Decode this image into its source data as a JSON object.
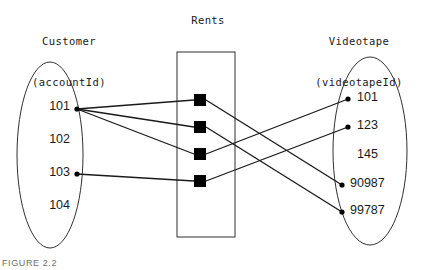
{
  "figure": {
    "caption": "FIGURE 2.2",
    "background_color": "#ffffff",
    "line_color": "#1a1a1a",
    "node_color": "#000000"
  },
  "customer_entity": {
    "heading_line1": "Customer",
    "heading_line2": "(accountId)",
    "attribute": "accountId",
    "values": [
      {
        "label": "101",
        "x": 70,
        "y": 112,
        "dot": true,
        "dot_x": 77,
        "dot_y": 109
      },
      {
        "label": "102",
        "x": 70,
        "y": 145,
        "dot": false,
        "dot_x": 77,
        "dot_y": 141
      },
      {
        "label": "103",
        "x": 70,
        "y": 178,
        "dot": true,
        "dot_x": 77,
        "dot_y": 174
      },
      {
        "label": "104",
        "x": 70,
        "y": 211,
        "dot": false,
        "dot_x": 77,
        "dot_y": 207
      }
    ],
    "ellipse": {
      "cx": 50,
      "cy": 155,
      "rx": 33,
      "ry": 93
    }
  },
  "rents_relationship": {
    "heading": "Rents",
    "box": {
      "x": 177,
      "y": 52,
      "width": 58,
      "height": 185
    },
    "nodes": [
      {
        "id": "rent-node-1",
        "x": 200,
        "y": 100,
        "size": 12
      },
      {
        "id": "rent-node-2",
        "x": 200,
        "y": 127,
        "size": 12
      },
      {
        "id": "rent-node-3",
        "x": 200,
        "y": 154,
        "size": 12
      },
      {
        "id": "rent-node-4",
        "x": 200,
        "y": 181,
        "size": 12
      }
    ]
  },
  "videotape_entity": {
    "heading_line1": "Videotape",
    "heading_line2": "(videotapeId)",
    "attribute": "videotapeId",
    "values": [
      {
        "label": "101",
        "x": 357,
        "y": 103,
        "dot": true,
        "dot_x": 348,
        "dot_y": 99
      },
      {
        "label": "123",
        "x": 357,
        "y": 131,
        "dot": true,
        "dot_x": 348,
        "dot_y": 127
      },
      {
        "label": "145",
        "x": 357,
        "y": 160,
        "dot": false,
        "dot_x": 348,
        "dot_y": 156
      },
      {
        "label": "90987",
        "x": 350,
        "y": 189,
        "dot": true,
        "dot_x": 342,
        "dot_y": 185
      },
      {
        "label": "99787",
        "x": 350,
        "y": 216,
        "dot": true,
        "dot_x": 342,
        "dot_y": 212
      }
    ],
    "ellipse": {
      "cx": 370,
      "cy": 151,
      "rx": 37,
      "ry": 94
    }
  },
  "connections": {
    "customer_to_rents": [
      {
        "from": "101",
        "to": "rent-node-1",
        "x1": 77,
        "y1": 109,
        "x2": 194,
        "y2": 100
      },
      {
        "from": "101",
        "to": "rent-node-2",
        "x1": 77,
        "y1": 109,
        "x2": 194,
        "y2": 127
      },
      {
        "from": "101",
        "to": "rent-node-3",
        "x1": 77,
        "y1": 109,
        "x2": 194,
        "y2": 154
      },
      {
        "from": "103",
        "to": "rent-node-4",
        "x1": 77,
        "y1": 174,
        "x2": 194,
        "y2": 181
      }
    ],
    "rents_to_videotape": [
      {
        "from": "rent-node-1",
        "to": "90987",
        "x1": 206,
        "y1": 100,
        "x2": 342,
        "y2": 185
      },
      {
        "from": "rent-node-2",
        "to": "99787",
        "x1": 206,
        "y1": 127,
        "x2": 342,
        "y2": 212
      },
      {
        "from": "rent-node-3",
        "to": "101",
        "x1": 206,
        "y1": 154,
        "x2": 348,
        "y2": 99
      },
      {
        "from": "rent-node-4",
        "to": "123",
        "x1": 206,
        "y1": 181,
        "x2": 348,
        "y2": 127
      }
    ]
  }
}
